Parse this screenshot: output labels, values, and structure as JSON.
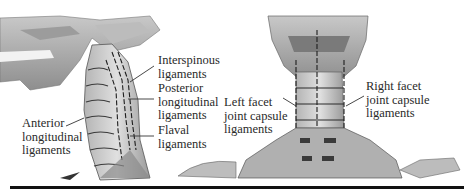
{
  "figure": {
    "left_panel": {
      "view": "lateral view of head and cervical spine",
      "labels": [
        {
          "id": "interspinous",
          "text": "Interspinous\nligaments"
        },
        {
          "id": "posterior-longitudinal",
          "text": "Posterior\nlongitudinal\nligaments"
        },
        {
          "id": "flaval",
          "text": "Flaval\nligaments"
        },
        {
          "id": "anterior-longitudinal",
          "text": "Anterior\nlongitudinal\nligaments"
        }
      ]
    },
    "right_panel": {
      "view": "posterior view of head, neck and shoulders",
      "labels": [
        {
          "id": "left-facet",
          "text": "Left facet\njoint capsule\nligaments"
        },
        {
          "id": "right-facet",
          "text": "Right facet\njoint capsule\nligaments"
        }
      ]
    },
    "colors": {
      "bone_light": "#d9d9d9",
      "bone_mid": "#a8a8a8",
      "bone_dark": "#5a5a5a",
      "ligament_line": "#1e1e1e",
      "text": "#2a2a2a",
      "rule": "#111111"
    }
  }
}
